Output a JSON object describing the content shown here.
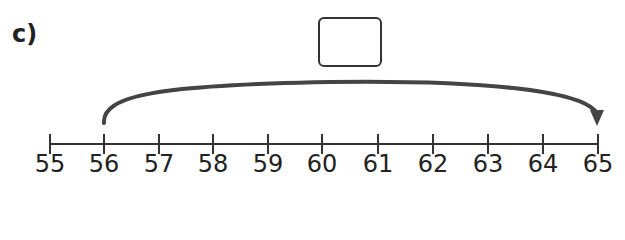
{
  "question_label": "c)",
  "answer_box": {
    "value": ""
  },
  "number_line": {
    "start": 55,
    "end": 65,
    "step": 1,
    "tick_labels": [
      "55",
      "56",
      "57",
      "58",
      "59",
      "60",
      "61",
      "62",
      "63",
      "64",
      "65"
    ],
    "jump": {
      "from": 56,
      "to": 65
    }
  },
  "colors": {
    "line": "#333333",
    "arc": "#444444",
    "text": "#222222"
  }
}
